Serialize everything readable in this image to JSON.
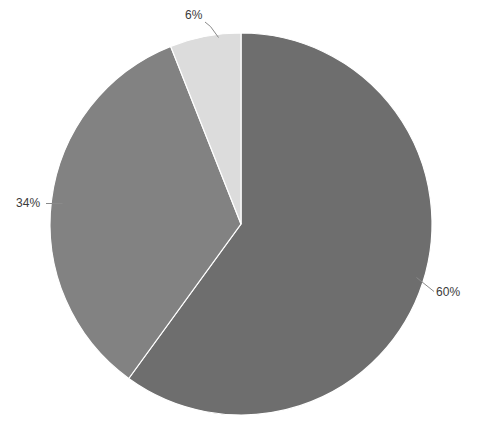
{
  "chart_data": {
    "type": "pie",
    "title": "",
    "subtitle": "",
    "xlabel": "",
    "ylabel": "",
    "legend_position": "none",
    "grid": false,
    "labels_show_percent": true,
    "start_angle_deg": 0,
    "direction": "clockwise",
    "categories": [
      "Slice 1",
      "Slice 2",
      "Slice 3"
    ],
    "values": [
      60,
      34,
      6
    ],
    "value_labels": [
      "60%",
      "34%",
      "6%"
    ],
    "colors": [
      "#6e6e6e",
      "#828282",
      "#dcdcdc"
    ],
    "slices": [
      {
        "label": "60%",
        "value": 60,
        "color": "#6e6e6e",
        "start_angle_deg": 0,
        "end_angle_deg": 216
      },
      {
        "label": "34%",
        "value": 34,
        "color": "#828282",
        "start_angle_deg": 216,
        "end_angle_deg": 338.4
      },
      {
        "label": "6%",
        "value": 6,
        "color": "#dcdcdc",
        "start_angle_deg": 338.4,
        "end_angle_deg": 360
      }
    ]
  },
  "chart": {
    "background_color": "#ffffff",
    "center_x": 241,
    "center_y": 224,
    "radius": 191,
    "slice_edge_color": "#ffffff",
    "leader_line_color": "#7a7a7a",
    "label_text_color": "#3a3a3a"
  },
  "labels": {
    "pct_6": "6%",
    "pct_34": "34%",
    "pct_60": "60%"
  },
  "watermark": {
    "text": "     "
  }
}
